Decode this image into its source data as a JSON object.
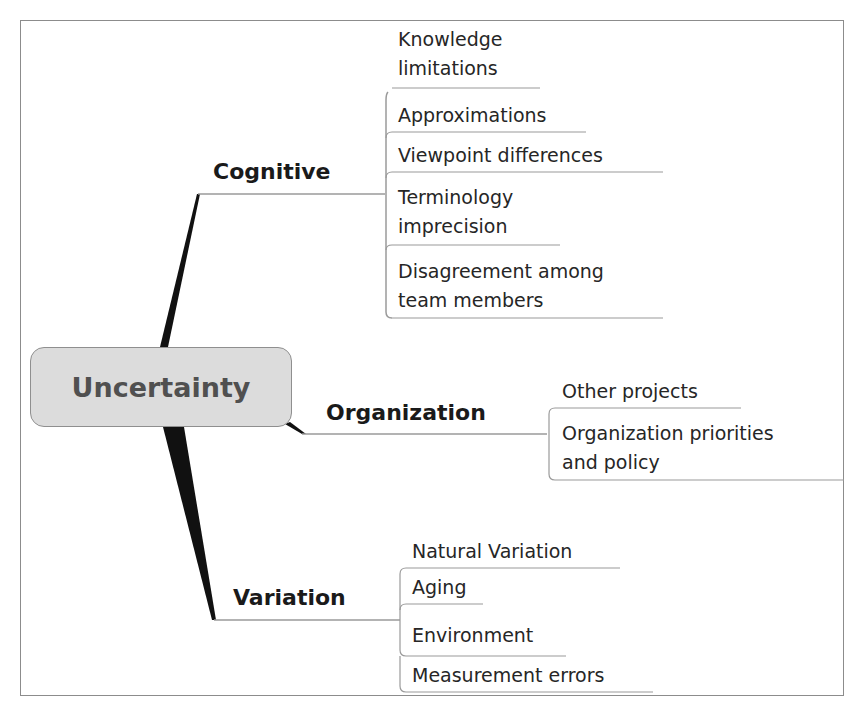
{
  "root": {
    "label": "Uncertainty"
  },
  "branches": [
    {
      "label": "Cognitive",
      "children": [
        "Knowledge\nlimitations",
        "Approximations",
        "Viewpoint differences",
        "Terminology\nimprecision",
        "Disagreement among\nteam members"
      ]
    },
    {
      "label": "Organization",
      "children": [
        "Other projects",
        "Organization priorities\nand policy"
      ]
    },
    {
      "label": "Variation",
      "children": [
        "Natural Variation",
        "Aging",
        "Environment",
        "Measurement errors"
      ]
    }
  ],
  "colors": {
    "root_fill": "#dcdcdc",
    "root_border": "#8f8f8f",
    "root_text": "#505050",
    "connector": "#111111",
    "underline": "#9a9a9a",
    "frame": "#8c8c8c"
  }
}
